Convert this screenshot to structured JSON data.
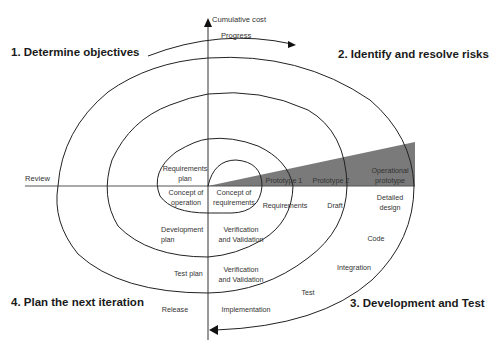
{
  "axes": {
    "vertical_label": "Cumulative cost",
    "horizontal_label": "Review",
    "progress_label": "Progress"
  },
  "quadrants": {
    "q1": "1. Determine objectives",
    "q2": "2. Identify and resolve risks",
    "q3": "3. Development and Test",
    "q4": "4. Plan the next iteration"
  },
  "labels": {
    "requirements_plan": [
      "Requirements",
      "plan"
    ],
    "concept_of_operation": [
      "Concept of",
      "operation"
    ],
    "concept_of_requirements": [
      "Concept of",
      "requirements"
    ],
    "prototype_1": "Prototype 1",
    "prototype_2": "Prototype 2",
    "operational_prototype": [
      "Operational",
      "prototype"
    ],
    "requirements": "Requirements",
    "draft": "Draft",
    "detailed_design": [
      "Detailed",
      "design"
    ],
    "development_plan": [
      "Development",
      "plan"
    ],
    "verification_validation_1": [
      "Verification",
      "and Validation"
    ],
    "code": "Code",
    "integration": "Integration",
    "test_plan": "Test plan",
    "verification_validation_2": [
      "Verification",
      "and Validation"
    ],
    "test": "Test",
    "release": "Release",
    "implementation": "Implementation"
  },
  "colors": {
    "line": "#222222",
    "wedge": "#7a7a7a",
    "text": "#333333"
  }
}
